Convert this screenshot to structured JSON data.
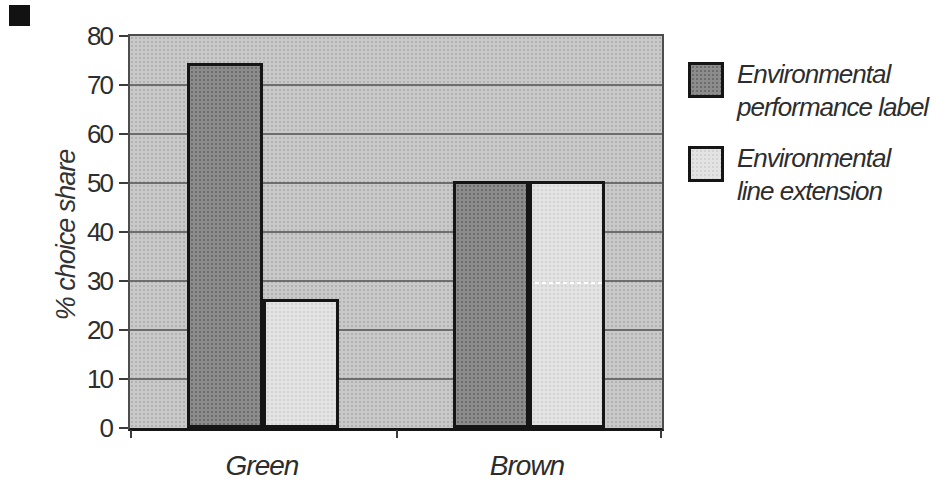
{
  "colors": {
    "plot_background": "#c9c9c9",
    "dark_series": "#8c8c8c",
    "light_series": "#e3e3e3",
    "gridline": "#5e5e5e",
    "bar_border": "#151515",
    "text": "#2d2d2d"
  },
  "legend": {
    "entries": [
      {
        "swatch": "dark",
        "lines": [
          "Environmental",
          "performance label"
        ]
      },
      {
        "swatch": "light",
        "lines": [
          "Environmental",
          "line extension"
        ]
      }
    ]
  },
  "chart_data": {
    "type": "bar",
    "categories": [
      "Green",
      "Brown"
    ],
    "series": [
      {
        "name": "Environmental performance label",
        "values": [
          74,
          50
        ],
        "color": "#8c8c8c",
        "style": "dark"
      },
      {
        "name": "Environmental line extension",
        "values": [
          26,
          50
        ],
        "color": "#e3e3e3",
        "style": "light"
      }
    ],
    "title": "",
    "xlabel": "",
    "ylabel": "% choice share",
    "ylim": [
      0,
      80
    ],
    "yticks": [
      0,
      10,
      20,
      30,
      40,
      50,
      60,
      70,
      80
    ],
    "grid": true,
    "legend_position": "right"
  }
}
